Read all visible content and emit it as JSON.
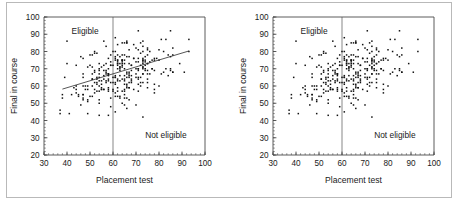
{
  "figure": {
    "panel_count": 2,
    "background": "#ffffff",
    "border_color": "#b9b9b9"
  },
  "chart_data": [
    {
      "id": "left-panel",
      "type": "scatter",
      "title": "",
      "xlabel": "Placement test",
      "ylabel": "Final in course",
      "xlim": [
        30,
        100
      ],
      "ylim": [
        20,
        100
      ],
      "xticks": [
        30,
        40,
        50,
        60,
        70,
        80,
        90,
        100
      ],
      "yticks": [
        20,
        30,
        40,
        50,
        60,
        70,
        80,
        90,
        100
      ],
      "xtick_labels": [
        "30",
        "40",
        "50",
        "60",
        "70",
        "80",
        "90",
        "100"
      ],
      "ytick_labels": [
        "20",
        "30",
        "40",
        "50",
        "60",
        "70",
        "80",
        "90",
        "100"
      ],
      "minor_ticks": true,
      "minor_tick_step": 2,
      "grid": false,
      "legend": null,
      "point_color": "#111111",
      "point_marker": "square",
      "point_size": 1.5,
      "annotations": [
        {
          "text": "Eligible",
          "x": 42,
          "y": 90,
          "align": "left"
        },
        {
          "text": "Not eligible",
          "x": 92,
          "y": 30,
          "align": "right"
        }
      ],
      "reference_lines": [
        {
          "orientation": "vertical",
          "value": 60,
          "color": "#555555",
          "width": 0.7
        }
      ],
      "trend_line": {
        "show": true,
        "x0": 38,
        "y0": 58.2,
        "x1": 93,
        "y1": 80.3,
        "slope": 0.402,
        "intercept": 42.9,
        "color": "#2b2b2b",
        "width": 0.8
      },
      "n_points": 300,
      "x_mean": 64.5,
      "y_mean": 67.5,
      "x_sd": 11.0,
      "y_sd": 10.2,
      "correlation": 0.43
    },
    {
      "id": "right-panel",
      "type": "scatter",
      "title": "",
      "xlabel": "Placement test",
      "ylabel": "Final in course",
      "xlim": [
        30,
        100
      ],
      "ylim": [
        20,
        100
      ],
      "xticks": [
        30,
        40,
        50,
        60,
        70,
        80,
        90,
        100
      ],
      "yticks": [
        20,
        30,
        40,
        50,
        60,
        70,
        80,
        90,
        100
      ],
      "xtick_labels": [
        "30",
        "40",
        "50",
        "60",
        "70",
        "80",
        "90",
        "100"
      ],
      "ytick_labels": [
        "20",
        "30",
        "40",
        "50",
        "60",
        "70",
        "80",
        "90",
        "100"
      ],
      "minor_ticks": true,
      "minor_tick_step": 2,
      "grid": false,
      "legend": null,
      "point_color": "#111111",
      "point_marker": "square",
      "point_size": 1.5,
      "annotations": [
        {
          "text": "Eligible",
          "x": 42,
          "y": 90,
          "align": "left"
        },
        {
          "text": "Not eligible",
          "x": 92,
          "y": 30,
          "align": "right"
        }
      ],
      "reference_lines": [
        {
          "orientation": "vertical",
          "value": 60,
          "color": "#555555",
          "width": 0.7
        }
      ],
      "trend_line": {
        "show": false
      },
      "n_points": 300,
      "x_mean": 64.5,
      "y_mean": 67.5,
      "x_sd": 11.0,
      "y_sd": 10.2,
      "correlation": 0.43
    }
  ]
}
